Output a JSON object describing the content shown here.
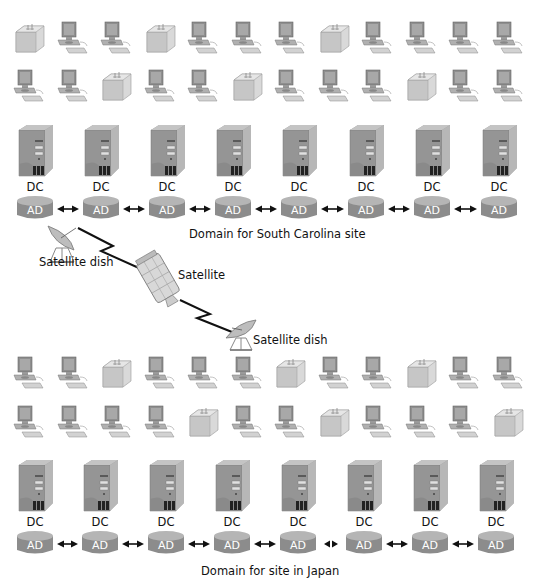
{
  "sites": [
    {
      "name": "south-carolina",
      "domain_label": "Domain for South Carolina site",
      "client_rows": [
        [
          "printer",
          "pc",
          "pc",
          "printer",
          "pc",
          "pc",
          "pc",
          "printer",
          "pc",
          "pc",
          "pc",
          "pc"
        ],
        [
          "pc",
          "pc",
          "printer",
          "pc",
          "pc",
          "printer",
          "pc",
          "pc",
          "pc",
          "printer",
          "pc",
          "pc"
        ]
      ],
      "controllers": [
        {
          "dc_label": "DC",
          "ad_label": "AD"
        },
        {
          "dc_label": "DC",
          "ad_label": "AD"
        },
        {
          "dc_label": "DC",
          "ad_label": "AD"
        },
        {
          "dc_label": "DC",
          "ad_label": "AD"
        },
        {
          "dc_label": "DC",
          "ad_label": "AD"
        },
        {
          "dc_label": "DC",
          "ad_label": "AD"
        },
        {
          "dc_label": "DC",
          "ad_label": "AD"
        },
        {
          "dc_label": "DC",
          "ad_label": "AD"
        }
      ],
      "links": [
        "bidirectional",
        "bidirectional",
        "bidirectional",
        "bidirectional",
        "bidirectional",
        "bidirectional",
        "bidirectional"
      ]
    },
    {
      "name": "japan",
      "domain_label": "Domain for site in Japan",
      "client_rows": [
        [
          "pc",
          "pc",
          "printer",
          "pc",
          "pc",
          "pc",
          "printer",
          "pc",
          "pc",
          "printer",
          "pc",
          "pc"
        ],
        [
          "pc",
          "pc",
          "pc",
          "pc",
          "printer",
          "pc",
          "pc",
          "printer",
          "pc",
          "pc",
          "pc",
          "printer"
        ]
      ],
      "controllers": [
        {
          "dc_label": "DC",
          "ad_label": "AD"
        },
        {
          "dc_label": "DC",
          "ad_label": "AD"
        },
        {
          "dc_label": "DC",
          "ad_label": "AD"
        },
        {
          "dc_label": "DC",
          "ad_label": "AD"
        },
        {
          "dc_label": "DC",
          "ad_label": "AD"
        },
        {
          "dc_label": "DC",
          "ad_label": "AD"
        },
        {
          "dc_label": "DC",
          "ad_label": "AD"
        },
        {
          "dc_label": "DC",
          "ad_label": "AD"
        }
      ],
      "links": [
        "bidirectional",
        "bidirectional",
        "bidirectional",
        "bidirectional",
        "broken",
        "bidirectional",
        "bidirectional"
      ]
    }
  ],
  "satellite_link": {
    "dish_top_label": "Satellite dish",
    "satellite_label": "Satellite",
    "dish_bottom_label": "Satellite dish"
  },
  "colors": {
    "ad_cylinder": "#8c8c8c",
    "ad_cylinder_top": "#b5b5b5",
    "server_body": "#9a9a9a",
    "arrow": "#111111",
    "lightning": "#111111"
  }
}
